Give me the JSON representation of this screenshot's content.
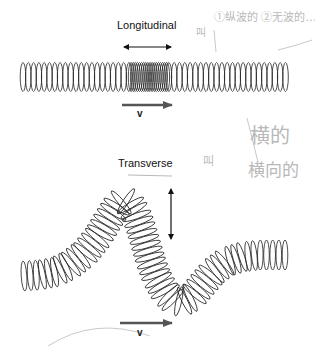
{
  "figure": {
    "longitudinal": {
      "label": "Longitudinal",
      "velocity_label": "v",
      "oscillation_direction": "horizontal (parallel to propagation)",
      "compression_region": "center"
    },
    "transverse": {
      "label": "Transverse",
      "velocity_label": "v",
      "oscillation_direction": "vertical (perpendicular to propagation)"
    },
    "handwritten_notes": {
      "note_top": "①纵波的 ②无波的…",
      "note_top_prefix": "叫",
      "note_middle_line1": "横的",
      "note_middle_line2": "横向的",
      "note_middle_prefix": "叫"
    },
    "colors": {
      "ink": "#111111",
      "arrow": "#555555",
      "pencil": "#bbbbbb"
    }
  }
}
